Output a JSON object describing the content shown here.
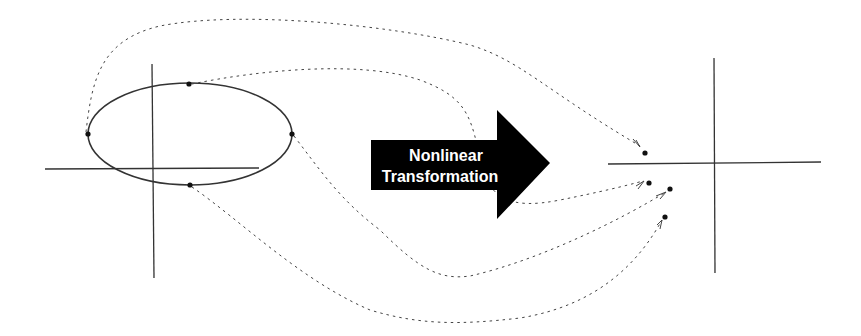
{
  "diagram": {
    "arrow": {
      "line1": "Nonlinear",
      "line2": "Transformation",
      "fill": "#000000",
      "text_color": "#ffffff"
    },
    "left_space": {
      "name": "input space",
      "ellipse": {
        "cx": 190,
        "cy": 134,
        "rx": 102,
        "ry": 51
      },
      "points": [
        {
          "id": "left",
          "x": 88,
          "y": 134
        },
        {
          "id": "top",
          "x": 189,
          "y": 84
        },
        {
          "id": "right",
          "x": 292,
          "y": 134
        },
        {
          "id": "bottom",
          "x": 190,
          "y": 185
        }
      ]
    },
    "right_space": {
      "name": "feature space",
      "points": [
        {
          "id": "left-mapped",
          "x": 645,
          "y": 153
        },
        {
          "id": "top-mapped",
          "x": 649,
          "y": 183
        },
        {
          "id": "right-mapped",
          "x": 670,
          "y": 189
        },
        {
          "id": "bottom-mapped",
          "x": 665,
          "y": 217
        }
      ]
    },
    "colors": {
      "line": "#333333",
      "dotted": "#444444",
      "point": "#111111"
    }
  }
}
